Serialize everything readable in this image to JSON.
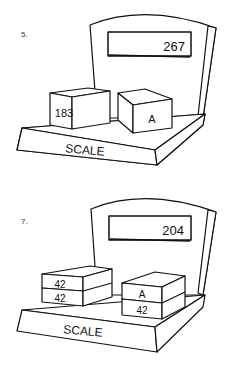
{
  "problems": [
    {
      "number": "5.",
      "display": "267",
      "base_label": "SCALE",
      "left_blocks": [
        "183"
      ],
      "right_blocks": [
        "A"
      ]
    },
    {
      "number": "7.",
      "display": "204",
      "base_label": "SCALE",
      "left_blocks": [
        "42",
        "42"
      ],
      "right_blocks": [
        "A",
        "42"
      ]
    }
  ]
}
